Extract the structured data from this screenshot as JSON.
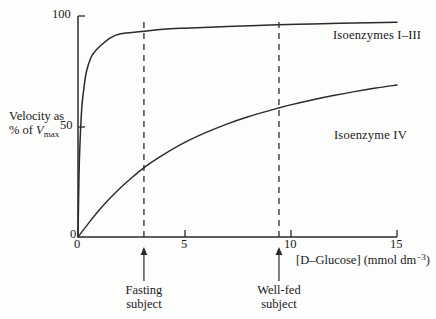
{
  "chart_data": {
    "type": "line",
    "title": "",
    "xlabel": "[D–Glucose] (mmol dm",
    "xlabel_sup": "−3",
    "xlabel_tail": ")",
    "ylabel_line1": "Velocity as",
    "ylabel_line2_pre": "% of ",
    "ylabel_line2_var": "V",
    "ylabel_line2_sub": "max",
    "xlim": [
      0,
      15
    ],
    "ylim": [
      0,
      100
    ],
    "xticks": [
      "0",
      "5",
      "10",
      "15"
    ],
    "xtick_values": [
      0,
      5,
      10,
      15
    ],
    "yticks": [
      "0",
      "50",
      "100"
    ],
    "ytick_values": [
      0,
      50,
      100
    ],
    "grid": false,
    "legend_position": "inline-right",
    "series": [
      {
        "name": "Isoenzymes I–III",
        "km": 0.12,
        "vmax_pct": 97,
        "x": [
          0,
          0.05,
          0.1,
          0.15,
          0.2,
          0.3,
          0.4,
          0.6,
          0.8,
          1.0,
          1.5,
          2.0,
          3.0,
          4.0,
          5.0,
          7.0,
          9.4,
          11.0,
          13.0,
          15.0
        ],
        "y": [
          0,
          29,
          44,
          54,
          61,
          69,
          75,
          81,
          84,
          86,
          90,
          92,
          93,
          94,
          94.5,
          95.2,
          96,
          96.4,
          96.8,
          97.2
        ]
      },
      {
        "name": "Isoenzyme IV",
        "km": 9.0,
        "vmax_pct": 97,
        "x": [
          0,
          0.5,
          1.0,
          1.5,
          2.0,
          2.5,
          3.0,
          3.4,
          4.0,
          5.0,
          6.0,
          7.0,
          8.0,
          9.0,
          9.4,
          10.0,
          11.0,
          12.0,
          13.0,
          14.0,
          15.0
        ],
        "y": [
          0,
          6.3,
          12.2,
          17.5,
          22.3,
          26.6,
          30.6,
          33.4,
          37.2,
          42.7,
          47.2,
          51.1,
          54.4,
          57.2,
          58.3,
          59.8,
          62.0,
          64.0,
          65.8,
          67.4,
          68.8
        ]
      }
    ],
    "markers": [
      {
        "label_line1": "Fasting",
        "label_line2": "subject",
        "x": 3.1
      },
      {
        "label_line1": "Well-fed",
        "label_line2": "subject",
        "x": 9.45
      }
    ],
    "colors": {
      "axis": "#2a2a2a",
      "curve": "#2a2a2a",
      "dashed": "#2a2a2a",
      "background": "#fdfdfc",
      "text": "#1a1a1a"
    }
  }
}
